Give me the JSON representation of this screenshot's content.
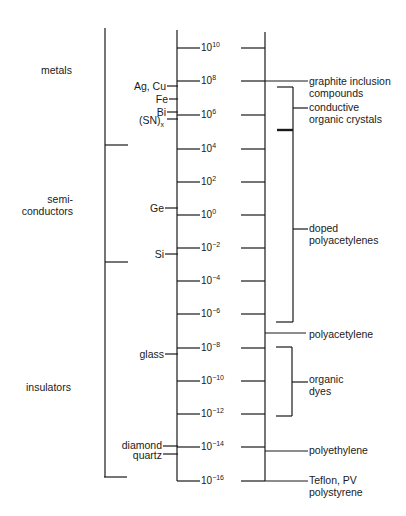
{
  "diagram": {
    "type": "conductivity-scale",
    "categories": [
      {
        "id": "metals",
        "label": "metals"
      },
      {
        "id": "semiconductors",
        "label_line1": "semi-",
        "label_line2": "conductors"
      },
      {
        "id": "insulators",
        "label": "insulators"
      }
    ],
    "scale_ticks": [
      {
        "base": "10",
        "exp": "10"
      },
      {
        "base": "10",
        "exp": "8"
      },
      {
        "base": "10",
        "exp": "6"
      },
      {
        "base": "10",
        "exp": "4"
      },
      {
        "base": "10",
        "exp": "2"
      },
      {
        "base": "10",
        "exp": "0"
      },
      {
        "base": "10",
        "exp": "−2"
      },
      {
        "base": "10",
        "exp": "−4"
      },
      {
        "base": "10",
        "exp": "−6"
      },
      {
        "base": "10",
        "exp": "−8"
      },
      {
        "base": "10",
        "exp": "−10"
      },
      {
        "base": "10",
        "exp": "−12"
      },
      {
        "base": "10",
        "exp": "−14"
      },
      {
        "base": "10",
        "exp": "−16"
      }
    ],
    "inorganic_materials": [
      {
        "label": "Ag, Cu"
      },
      {
        "label": "Fe"
      },
      {
        "label": "Bi"
      },
      {
        "label": "(SN)",
        "subscript": "x"
      },
      {
        "label": "Ge"
      },
      {
        "label": "Si"
      },
      {
        "label": "glass"
      },
      {
        "label": "diamond"
      },
      {
        "label": "quartz"
      }
    ],
    "polymer_materials": [
      {
        "line1": "graphite inclusion",
        "line2": "compounds"
      },
      {
        "line1": "conductive",
        "line2": "organic crystals"
      },
      {
        "line1": "doped",
        "line2": "polyacetylenes"
      },
      {
        "line1": "polyacetylene"
      },
      {
        "line1": "organic",
        "line2": "dyes"
      },
      {
        "line1": "polyethylene"
      },
      {
        "line1": "Teflon, PV",
        "line2": "polystyrene"
      }
    ]
  }
}
